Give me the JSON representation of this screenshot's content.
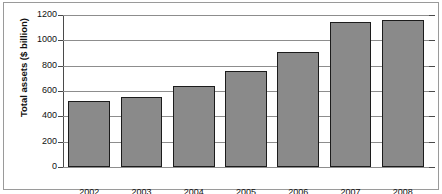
{
  "chart_data": {
    "type": "bar",
    "title": "",
    "xlabel": "",
    "ylabel": "Total assets ($ billion)",
    "categories": [
      "2002",
      "2003",
      "2004",
      "2005",
      "2006",
      "2007",
      "2008"
    ],
    "values": [
      520,
      550,
      640,
      760,
      910,
      1145,
      1160
    ],
    "ylim": [
      0,
      1200
    ],
    "yticks": [
      0,
      200,
      400,
      600,
      800,
      1000,
      1200
    ],
    "ytick_labels": [
      "0",
      "200",
      "400",
      "600",
      "800",
      "1000",
      "1200"
    ],
    "grid": true,
    "legend": null,
    "bar_fill_color": "#8a8a8a",
    "bar_edge_color": "#1c1c1c",
    "gridline_color": "#8d8d8d",
    "axis_color": "#4a4a4a",
    "frame_color": "#9a9a9a",
    "background_color": "#ffffff"
  }
}
